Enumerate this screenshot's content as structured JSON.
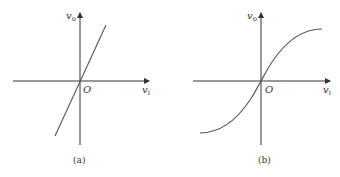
{
  "figure": {
    "panels": [
      {
        "id": "a",
        "caption": "(a)",
        "x_axis_label": "v",
        "x_axis_sub": "i",
        "y_axis_label": "v",
        "y_axis_sub": "o",
        "origin_label": "O",
        "curve_type": "linear"
      },
      {
        "id": "b",
        "caption": "(b)",
        "x_axis_label": "v",
        "x_axis_sub": "i",
        "y_axis_label": "v",
        "y_axis_sub": "o",
        "origin_label": "O",
        "curve_type": "sigmoid"
      }
    ],
    "colors": {
      "axis": "#333333",
      "curve": "#555555",
      "text": "#333333"
    }
  }
}
